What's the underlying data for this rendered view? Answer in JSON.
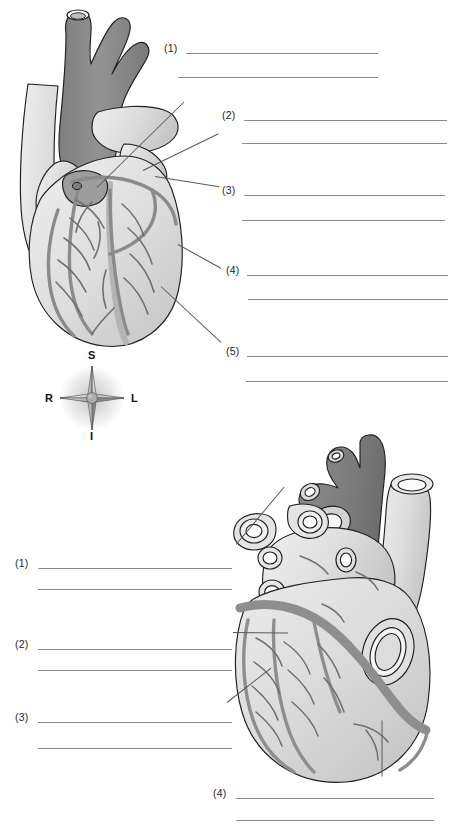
{
  "worksheet": {
    "title": "Heart Anatomy Labeling Worksheet",
    "top_figure": {
      "name": "anterior-view-of-heart",
      "caption": "",
      "labels": [
        {
          "id": "1",
          "text": "(1)",
          "answer": ""
        },
        {
          "id": "2",
          "text": "(2)",
          "answer": ""
        },
        {
          "id": "3",
          "text": "(3)",
          "answer": ""
        },
        {
          "id": "4",
          "text": "(4)",
          "answer": ""
        },
        {
          "id": "5",
          "text": "(5)",
          "answer": ""
        }
      ]
    },
    "bottom_figure": {
      "name": "posterior-view-of-heart",
      "caption": "",
      "labels": [
        {
          "id": "1",
          "text": "(1)",
          "answer": ""
        },
        {
          "id": "2",
          "text": "(2)",
          "answer": ""
        },
        {
          "id": "3",
          "text": "(3)",
          "answer": ""
        },
        {
          "id": "4",
          "text": "(4)",
          "answer": ""
        }
      ]
    },
    "compass": {
      "name": "orientation-compass-rose",
      "superior": "S",
      "inferior": "I",
      "right": "R",
      "left": "L"
    },
    "colors": {
      "background": "#ffffff",
      "ink": "#1a1a1a",
      "rule_line": "#8d8d8d",
      "leader_line": "#5a5a5a",
      "vessel_dark": "#8f8f8f",
      "vessel_mid": "#a8a8a8",
      "myocardium_light": "#e2e2e2",
      "myocardium_shade": "#cfcfcf",
      "outline": "#1f1f1f"
    }
  }
}
